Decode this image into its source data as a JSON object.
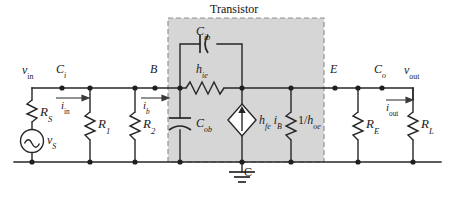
{
  "figure": {
    "kind": "circuit-schematic",
    "background_color": "#ffffff",
    "wire_color": "#262626",
    "box_fill": "#d4d4d4",
    "box_border": "#8c8c8c"
  },
  "transistor_box": {
    "title": "Transistor"
  },
  "node_labels": {
    "vin": {
      "main": "v",
      "sub": "in"
    },
    "ci": {
      "main": "C",
      "sub": "i"
    },
    "b": {
      "main": "B",
      "sub": ""
    },
    "e": {
      "main": "E",
      "sub": ""
    },
    "co": {
      "main": "C",
      "sub": "o"
    },
    "vout": {
      "main": "v",
      "sub": "out"
    },
    "c_ground": {
      "main": "C",
      "sub": ""
    }
  },
  "currents": {
    "iin": {
      "main": "i",
      "sub": "in"
    },
    "ib": {
      "main": "i",
      "sub": "b"
    },
    "iout": {
      "main": "i",
      "sub": "out"
    }
  },
  "components": {
    "rs": {
      "main": "R",
      "sub": "S"
    },
    "vs": {
      "main": "v",
      "sub": "S"
    },
    "r1": {
      "main": "R",
      "sub": "1"
    },
    "r2": {
      "main": "R",
      "sub": "2"
    },
    "cib": {
      "main": "C",
      "sub": "ib"
    },
    "cob": {
      "main": "C",
      "sub": "ob"
    },
    "hie": {
      "main": "h",
      "sub": "ie"
    },
    "source_dep": {
      "main": "h",
      "sub": "fe",
      "main2": "i",
      "sub2": "B"
    },
    "hoe": {
      "prefix": "1/",
      "main": "h",
      "sub": "oe"
    },
    "re": {
      "main": "R",
      "sub": "E"
    },
    "rl": {
      "main": "R",
      "sub": "L"
    }
  },
  "symbols": {
    "ac_source": "sine-wave",
    "ground": "earth-ground",
    "dependent_source": "diamond-current-source",
    "capacitor_cib": "capacitor-curved",
    "capacitor_cob": "capacitor-curved",
    "resistor": "zigzag"
  }
}
